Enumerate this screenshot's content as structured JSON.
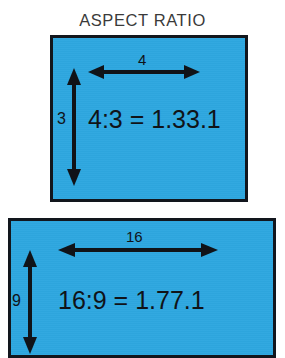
{
  "title": "ASPECT RATIO",
  "colors": {
    "box_fill": "#2ea7e0",
    "box_border": "#12161d",
    "text": "#101318",
    "title_text": "#3a3a3a",
    "background": "#ffffff"
  },
  "diagrams": [
    {
      "id": "aspect-ratio-4-3",
      "width_label": "4",
      "height_label": "3",
      "ratio_text": "4:3 = 1.33.1",
      "width_arrow": "horizontal-double-arrow",
      "height_arrow": "vertical-double-arrow"
    },
    {
      "id": "aspect-ratio-16-9",
      "width_label": "16",
      "height_label": "9",
      "ratio_text": "16:9 = 1.77.1",
      "width_arrow": "horizontal-double-arrow",
      "height_arrow": "vertical-double-arrow"
    }
  ]
}
